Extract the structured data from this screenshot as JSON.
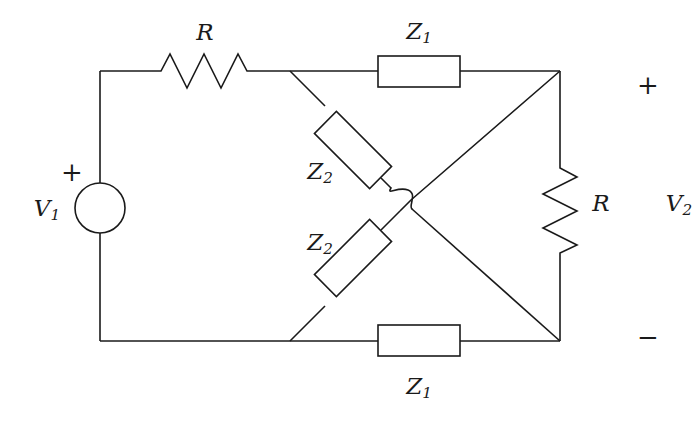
{
  "diagram": {
    "type": "circuit-schematic",
    "background_color": "#ffffff",
    "stroke_color": "#1a1a1a",
    "stroke_width": 1.6,
    "width": 700,
    "height": 422
  },
  "source": {
    "label": "V",
    "subscript": "1",
    "polarity_plus": "+",
    "component": "voltage-source-circle",
    "center": [
      100,
      208
    ],
    "radius": 25,
    "label_pos": [
      47,
      208
    ],
    "plus_pos": [
      72,
      172
    ]
  },
  "output": {
    "label": "V",
    "subscript": "2",
    "polarity_plus": "+",
    "polarity_minus": "−",
    "label_pos": [
      679,
      203
    ],
    "plus_pos": [
      648,
      85
    ],
    "minus_pos": [
      648,
      337
    ]
  },
  "components": [
    {
      "id": "r-series",
      "label": "R",
      "subscript": "",
      "kind": "resistor-zigzag",
      "orientation": "horizontal",
      "label_pos": [
        205,
        32
      ],
      "span": [
        152,
        71,
        255,
        71
      ]
    },
    {
      "id": "z1-top",
      "label": "Z",
      "subscript": "1",
      "kind": "impedance-box",
      "orientation": "horizontal",
      "label_pos": [
        419,
        31
      ],
      "box": [
        378,
        56,
        82,
        31
      ]
    },
    {
      "id": "z2-upper",
      "label": "Z",
      "subscript": "2",
      "kind": "impedance-box",
      "orientation": "diagonal-down-right",
      "label_pos": [
        320,
        171
      ],
      "box_center": [
        353,
        150
      ],
      "box_size": [
        78,
        31
      ],
      "rotation_deg": 45
    },
    {
      "id": "z2-lower",
      "label": "Z",
      "subscript": "2",
      "kind": "impedance-box",
      "orientation": "diagonal-up-right",
      "label_pos": [
        320,
        242
      ],
      "box_center": [
        353,
        258
      ],
      "box_size": [
        78,
        31
      ],
      "rotation_deg": -45
    },
    {
      "id": "z1-bottom",
      "label": "Z",
      "subscript": "1",
      "kind": "impedance-box",
      "orientation": "horizontal",
      "label_pos": [
        419,
        386
      ],
      "box": [
        378,
        325,
        82,
        31
      ]
    },
    {
      "id": "r-load",
      "label": "R",
      "subscript": "",
      "kind": "resistor-zigzag",
      "orientation": "vertical",
      "label_pos": [
        601,
        203
      ],
      "span": [
        560,
        160,
        560,
        260
      ]
    }
  ],
  "nodes": {
    "top_left_corner": [
      100,
      71
    ],
    "bottom_left_corner": [
      100,
      341
    ],
    "bridge_left_top": [
      290,
      71
    ],
    "bridge_left_bottom": [
      290,
      341
    ],
    "bridge_right_top": [
      560,
      71
    ],
    "bridge_right_bottom": [
      560,
      341
    ],
    "crossing": [
      400,
      197
    ]
  },
  "wire_hop": {
    "present": true,
    "description": "semicircular wire hop where the two bridge diagonals cross",
    "position": [
      400,
      197
    ]
  }
}
